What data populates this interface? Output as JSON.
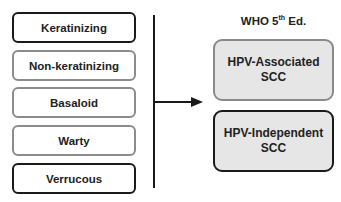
{
  "left_subtypes": [
    {
      "label": "Keratinizing",
      "border": "dark"
    },
    {
      "label": "Non-keratinizing",
      "border": "gray"
    },
    {
      "label": "Basaloid",
      "border": "gray"
    },
    {
      "label": "Warty",
      "border": "gray"
    },
    {
      "label": "Verrucous",
      "border": "dark"
    }
  ],
  "header": {
    "prefix": "WHO 5",
    "sup": "th",
    "suffix": " Ed."
  },
  "right_categories": [
    {
      "line1": "HPV-Associated",
      "line2": "SCC",
      "border": "gray"
    },
    {
      "line1": "HPV-Independent",
      "line2": "SCC",
      "border": "dark"
    }
  ],
  "colors": {
    "dark_border": "#1a1a1a",
    "gray_border": "#8c8c8c",
    "fill": "#e6e6e6"
  }
}
